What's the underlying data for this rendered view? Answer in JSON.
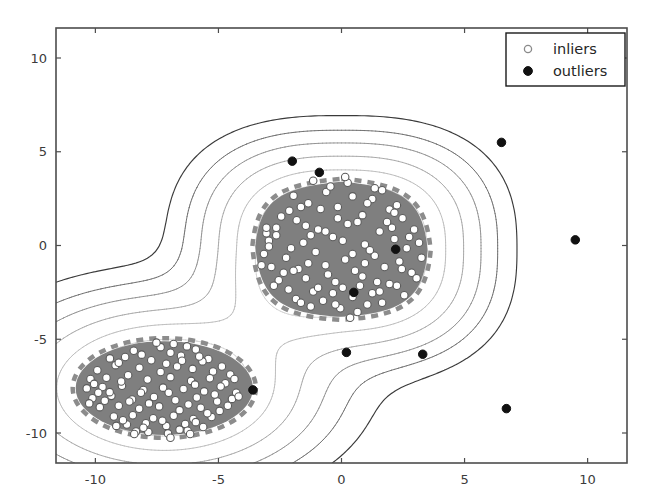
{
  "figure": {
    "background_color": "#ffffff",
    "width": 651,
    "height": 502
  },
  "axes": {
    "frame_color": "#4d4d4d",
    "x": {
      "label": "",
      "ticks": [
        -10,
        -5,
        0,
        5,
        10
      ],
      "tick_labels": [
        "-10",
        "-5",
        "0",
        "5",
        "10"
      ],
      "limits": [
        -11.6,
        11.6
      ]
    },
    "y": {
      "label": "",
      "ticks": [
        10,
        5,
        0,
        -5,
        -10
      ],
      "tick_labels": [
        "10",
        "5",
        "0",
        "-5",
        "-10"
      ],
      "limits": [
        -11.6,
        11.6
      ]
    }
  },
  "legend": {
    "position": "upper-right",
    "border_color": "#1a1a1a",
    "background": "#ffffff",
    "entries": [
      {
        "label": "inliers",
        "marker": "open-circle",
        "face_color": "#ffffff",
        "edge_color": "#7a7a7a"
      },
      {
        "label": "outliers",
        "marker": "filled-circle",
        "face_color": "#111111",
        "edge_color": "#111111"
      }
    ]
  },
  "chart_data": {
    "type": "scatter",
    "title": "",
    "xlabel": "",
    "ylabel": "",
    "xlim": [
      -11.6,
      11.6
    ],
    "ylim": [
      -11.6,
      11.6
    ],
    "grid": false,
    "legend_position": "upper right",
    "decision_regions": {
      "fill_color": "#7f7f7f",
      "boundary_style": "dashed",
      "boundary_color": "#8c8c8c",
      "description": "Two shaded inlier-decision regions: an ellipse around the lower-left cluster and a rounded-diamond around the upper-middle cluster.",
      "regions": [
        {
          "name": "lower-left-region",
          "shape": "ellipse",
          "center": [
            -7.2,
            -7.6
          ],
          "radius_x": 3.6,
          "radius_y": 2.5
        },
        {
          "name": "upper-middle-region",
          "shape": "rounded-diamond",
          "center": [
            0.0,
            -0.2
          ],
          "radius_x": 3.5,
          "radius_y": 3.6
        }
      ]
    },
    "contour_levels": {
      "count": 7,
      "colors": [
        "#3a3a3a",
        "#6e6e6e",
        "#909090",
        "#a8a8a8",
        "#bdbdbd",
        "#d2d2d2",
        "#e2e2e2"
      ],
      "description": "Nested decision-function contour lines getting lighter toward the cluster interiors"
    },
    "series": [
      {
        "name": "inliers",
        "marker": "o",
        "face_color": "#ffffff",
        "edge_color": "#5a5a5a",
        "size": 7.5,
        "count": 400,
        "clusters": [
          {
            "center": [
              -7.2,
              -7.6
            ],
            "spread_x": 2.6,
            "spread_y": 1.8,
            "count": 200
          },
          {
            "center": [
              0.0,
              -0.2
            ],
            "spread_x": 2.2,
            "spread_y": 2.2,
            "count": 200
          }
        ],
        "points": [
          [
            -7.35,
            -5.42
          ],
          [
            -6.28,
            -5.38
          ],
          [
            -5.92,
            -5.55
          ],
          [
            -8.44,
            -5.61
          ],
          [
            -6.82,
            -5.25
          ],
          [
            -9.41,
            -6.02
          ],
          [
            -8.79,
            -5.95
          ],
          [
            -7.73,
            -6.12
          ],
          [
            -6.52,
            -5.88
          ],
          [
            -5.41,
            -6.05
          ],
          [
            -4.86,
            -6.45
          ],
          [
            -9.92,
            -6.65
          ],
          [
            -9.18,
            -6.38
          ],
          [
            -8.21,
            -6.52
          ],
          [
            -7.12,
            -6.31
          ],
          [
            -6.05,
            -6.58
          ],
          [
            -5.22,
            -6.72
          ],
          [
            -10.2,
            -7.12
          ],
          [
            -9.55,
            -7.05
          ],
          [
            -8.67,
            -6.92
          ],
          [
            -7.88,
            -7.15
          ],
          [
            -6.95,
            -7.02
          ],
          [
            -6.11,
            -7.22
          ],
          [
            -5.35,
            -7.08
          ],
          [
            -4.72,
            -7.35
          ],
          [
            -10.35,
            -7.62
          ],
          [
            -9.71,
            -7.55
          ],
          [
            -8.92,
            -7.48
          ],
          [
            -8.05,
            -7.71
          ],
          [
            -7.25,
            -7.58
          ],
          [
            -6.42,
            -7.65
          ],
          [
            -5.58,
            -7.78
          ],
          [
            -4.91,
            -7.52
          ],
          [
            -4.28,
            -7.85
          ],
          [
            -10.12,
            -8.15
          ],
          [
            -9.35,
            -8.02
          ],
          [
            -8.51,
            -8.21
          ],
          [
            -7.62,
            -8.08
          ],
          [
            -6.75,
            -8.25
          ],
          [
            -5.88,
            -8.11
          ],
          [
            -5.05,
            -8.32
          ],
          [
            -4.45,
            -8.18
          ],
          [
            -9.82,
            -8.62
          ],
          [
            -9.05,
            -8.55
          ],
          [
            -8.22,
            -8.71
          ],
          [
            -7.41,
            -8.58
          ],
          [
            -6.58,
            -8.78
          ],
          [
            -5.72,
            -8.65
          ],
          [
            -4.95,
            -8.82
          ],
          [
            -9.25,
            -9.12
          ],
          [
            -8.48,
            -9.05
          ],
          [
            -7.65,
            -9.21
          ],
          [
            -6.82,
            -9.08
          ],
          [
            -6.02,
            -9.25
          ],
          [
            -5.28,
            -9.15
          ],
          [
            -8.72,
            -9.55
          ],
          [
            -7.95,
            -9.48
          ],
          [
            -7.12,
            -9.62
          ],
          [
            -6.35,
            -9.52
          ],
          [
            -5.62,
            -9.68
          ],
          [
            -7.85,
            -9.95
          ],
          [
            -7.05,
            -10.02
          ],
          [
            -6.25,
            -9.88
          ],
          [
            -8.35,
            -9.92
          ],
          [
            -6.95,
            -10.25
          ],
          [
            -7.52,
            -5.18
          ],
          [
            -6.95,
            -5.72
          ],
          [
            -8.12,
            -5.82
          ],
          [
            -9.05,
            -6.25
          ],
          [
            -5.65,
            -6.18
          ],
          [
            -4.52,
            -6.88
          ],
          [
            -10.05,
            -7.38
          ],
          [
            -9.42,
            -7.82
          ],
          [
            -8.62,
            -8.32
          ],
          [
            -7.82,
            -8.42
          ],
          [
            -6.68,
            -6.45
          ],
          [
            -5.95,
            -7.42
          ],
          [
            -5.15,
            -7.95
          ],
          [
            -4.62,
            -8.55
          ],
          [
            -9.62,
            -8.28
          ],
          [
            -8.95,
            -7.25
          ],
          [
            -8.15,
            -7.85
          ],
          [
            -7.35,
            -6.75
          ],
          [
            -6.48,
            -6.15
          ],
          [
            -5.78,
            -5.92
          ],
          [
            -7.02,
            -7.85
          ],
          [
            -6.22,
            -8.48
          ],
          [
            -5.45,
            -8.95
          ],
          [
            -8.88,
            -9.32
          ],
          [
            -8.05,
            -9.72
          ],
          [
            -7.28,
            -9.35
          ],
          [
            -6.58,
            -9.82
          ],
          [
            -9.88,
            -7.85
          ],
          [
            -10.25,
            -8.42
          ],
          [
            -4.35,
            -7.12
          ],
          [
            -4.18,
            -8.05
          ],
          [
            -6.15,
            -10.05
          ],
          [
            -5.92,
            -9.42
          ],
          [
            -9.15,
            -9.62
          ],
          [
            -8.42,
            -10.05
          ],
          [
            -0.62,
            2.85
          ],
          [
            0.45,
            2.62
          ],
          [
            -1.35,
            2.25
          ],
          [
            1.25,
            2.48
          ],
          [
            -2.12,
            1.85
          ],
          [
            1.95,
            1.92
          ],
          [
            -0.15,
            2.05
          ],
          [
            0.85,
            1.62
          ],
          [
            -1.82,
            1.35
          ],
          [
            2.48,
            1.45
          ],
          [
            -2.65,
            0.95
          ],
          [
            -0.95,
            0.85
          ],
          [
            0.25,
            1.15
          ],
          [
            1.55,
            0.75
          ],
          [
            2.15,
            0.35
          ],
          [
            -2.95,
            0.25
          ],
          [
            -1.55,
            0.15
          ],
          [
            -0.35,
            0.45
          ],
          [
            0.95,
            0.05
          ],
          [
            2.65,
            -0.15
          ],
          [
            -3.15,
            -0.45
          ],
          [
            -2.25,
            -0.65
          ],
          [
            -1.05,
            -0.35
          ],
          [
            0.15,
            -0.75
          ],
          [
            1.35,
            -0.55
          ],
          [
            2.35,
            -0.85
          ],
          [
            -2.85,
            -1.15
          ],
          [
            -1.75,
            -1.25
          ],
          [
            -0.65,
            -1.05
          ],
          [
            0.55,
            -1.35
          ],
          [
            1.75,
            -1.15
          ],
          [
            2.85,
            -1.45
          ],
          [
            -2.55,
            -1.85
          ],
          [
            -1.45,
            -1.75
          ],
          [
            -0.25,
            -1.95
          ],
          [
            0.85,
            -1.65
          ],
          [
            1.95,
            -2.05
          ],
          [
            -2.15,
            -2.35
          ],
          [
            -1.15,
            -2.45
          ],
          [
            0.05,
            -2.25
          ],
          [
            1.25,
            -2.55
          ],
          [
            2.25,
            -2.15
          ],
          [
            -1.85,
            -2.85
          ],
          [
            -0.75,
            -2.95
          ],
          [
            0.45,
            -2.75
          ],
          [
            1.65,
            -3.05
          ],
          [
            -1.25,
            -3.25
          ],
          [
            -0.05,
            -3.35
          ],
          [
            1.05,
            -3.15
          ],
          [
            0.65,
            -3.55
          ],
          [
            -0.45,
            3.15
          ],
          [
            0.25,
            3.35
          ],
          [
            1.65,
            2.95
          ],
          [
            -1.95,
            2.65
          ],
          [
            2.25,
            2.15
          ],
          [
            -2.45,
            1.55
          ],
          [
            -3.05,
            0.65
          ],
          [
            2.95,
            0.85
          ],
          [
            3.15,
            0.15
          ],
          [
            -3.25,
            -1.05
          ],
          [
            3.05,
            -1.75
          ],
          [
            -2.75,
            -2.15
          ],
          [
            2.55,
            -2.65
          ],
          [
            -1.65,
            -3.05
          ],
          [
            0.35,
            -3.85
          ],
          [
            -0.85,
            1.95
          ],
          [
            0.65,
            1.25
          ],
          [
            -1.25,
            0.55
          ],
          [
            1.15,
            -0.25
          ],
          [
            -0.55,
            -1.55
          ],
          [
            1.45,
            -1.95
          ],
          [
            -2.05,
            -0.15
          ],
          [
            2.05,
            0.95
          ],
          [
            -0.15,
            1.45
          ],
          [
            0.05,
            0.25
          ],
          [
            -1.45,
            1.05
          ],
          [
            1.85,
            1.25
          ],
          [
            -2.35,
            -1.45
          ],
          [
            0.75,
            -2.15
          ],
          [
            -0.95,
            -2.25
          ],
          [
            2.75,
            0.45
          ],
          [
            -3.05,
            0.95
          ],
          [
            1.05,
            2.25
          ],
          [
            -1.65,
            2.05
          ],
          [
            0.45,
            -0.45
          ],
          [
            -0.35,
            -2.55
          ],
          [
            1.55,
            -2.45
          ],
          [
            -1.95,
            -1.35
          ],
          [
            2.45,
            -1.25
          ],
          [
            -2.65,
            0.55
          ],
          [
            0.15,
            3.65
          ],
          [
            -1.15,
            3.45
          ],
          [
            1.35,
            3.05
          ],
          [
            -0.25,
            -3.15
          ],
          [
            0.95,
            -0.95
          ],
          [
            -1.35,
            -0.95
          ],
          [
            2.15,
            1.75
          ],
          [
            -2.95,
            -0.05
          ],
          [
            3.25,
            -0.65
          ],
          [
            -0.65,
            0.75
          ]
        ]
      },
      {
        "name": "outliers",
        "marker": "o",
        "face_color": "#111111",
        "edge_color": "#111111",
        "size": 8.5,
        "count": 10,
        "points": [
          [
            -2.0,
            4.5
          ],
          [
            -0.9,
            3.9
          ],
          [
            6.5,
            5.5
          ],
          [
            2.2,
            -0.2
          ],
          [
            9.5,
            0.3
          ],
          [
            0.5,
            -2.5
          ],
          [
            0.2,
            -5.7
          ],
          [
            3.3,
            -5.8
          ],
          [
            6.7,
            -8.7
          ],
          [
            -3.6,
            -7.7
          ]
        ]
      }
    ]
  }
}
